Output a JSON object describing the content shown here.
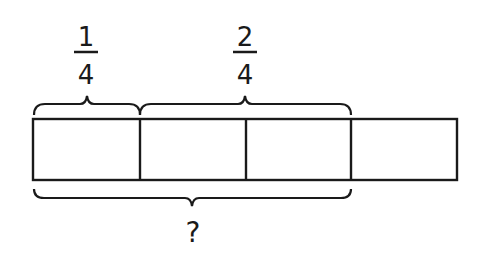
{
  "diagram": {
    "type": "tape-diagram",
    "total_parts": 4,
    "labels": {
      "top_left": {
        "numerator": "1",
        "denominator": "4",
        "spans_parts": 1
      },
      "top_right": {
        "numerator": "2",
        "denominator": "4",
        "spans_parts": 2
      },
      "bottom": {
        "text": "?",
        "spans_parts": 3
      }
    },
    "colors": {
      "stroke": "#1a1a1a",
      "background": "#ffffff"
    }
  }
}
